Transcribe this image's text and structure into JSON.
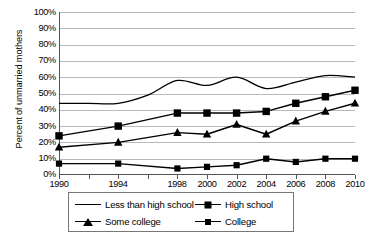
{
  "chart_data": {
    "type": "line",
    "title": "",
    "xlabel": "",
    "ylabel": "Percent of unmarried mothers",
    "xlim": [
      1990,
      2010
    ],
    "ylim": [
      0,
      100
    ],
    "grid": true,
    "legend_position": "bottom",
    "y_ticks": [
      "0%",
      "10%",
      "20%",
      "30%",
      "40%",
      "50%",
      "60%",
      "70%",
      "80%",
      "90%",
      "100%"
    ],
    "y_tick_values": [
      0,
      10,
      20,
      30,
      40,
      50,
      60,
      70,
      80,
      90,
      100
    ],
    "x_ticks": [
      "1990",
      "1994",
      "1998",
      "2000",
      "2002",
      "2004",
      "2006",
      "2008",
      "2010"
    ],
    "x_tick_values": [
      1990,
      1994,
      1998,
      2000,
      2002,
      2004,
      2006,
      2008,
      2010
    ],
    "x_minor_ticks": [
      1990,
      1992,
      1994,
      1996,
      1998,
      2000,
      2002,
      2004,
      2006,
      2008,
      2010
    ],
    "series": [
      {
        "name": "Less than high school",
        "marker": "none",
        "x": [
          1990,
          1992,
          1994,
          1996,
          1998,
          2000,
          2002,
          2004,
          2006,
          2008,
          2010
        ],
        "values": [
          44,
          44,
          44,
          49,
          58,
          55,
          60,
          53,
          57,
          61,
          60
        ]
      },
      {
        "name": "High school",
        "marker": "square",
        "x": [
          1990,
          1994,
          1998,
          2000,
          2002,
          2004,
          2006,
          2008,
          2010
        ],
        "values": [
          24,
          30,
          38,
          38,
          38,
          39,
          44,
          48,
          52
        ]
      },
      {
        "name": "Some college",
        "marker": "triangle",
        "x": [
          1990,
          1994,
          1998,
          2000,
          2002,
          2004,
          2006,
          2008,
          2010
        ],
        "values": [
          17,
          20,
          26,
          25,
          31,
          25,
          33,
          39,
          44
        ]
      },
      {
        "name": "College",
        "marker": "square-small",
        "x": [
          1990,
          1994,
          1998,
          2000,
          2002,
          2004,
          2006,
          2008,
          2010
        ],
        "values": [
          7,
          7,
          4,
          5,
          6,
          10,
          8,
          10,
          10
        ]
      }
    ]
  },
  "legend": {
    "entries": [
      {
        "label": "Less than high school",
        "key": "plain-line"
      },
      {
        "label": "High school",
        "key": "square-marker"
      },
      {
        "label": "Some college",
        "key": "triangle-marker"
      },
      {
        "label": "College",
        "key": "small-square-marker"
      }
    ]
  },
  "colors": {
    "series_line": "#000000",
    "gridline": "#b9b9b9",
    "axis": "#555555",
    "background": "#ffffff"
  }
}
